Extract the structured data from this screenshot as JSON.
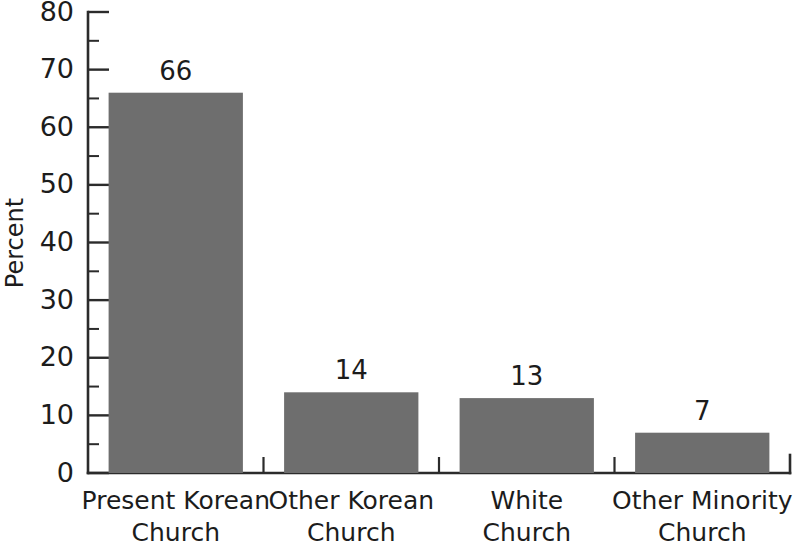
{
  "chart_data": {
    "type": "bar",
    "title": "",
    "subtitle": "",
    "xlabel": "",
    "ylabel": "Percent",
    "categories": [
      "Present Korean Church",
      "Other Korean Church",
      "White Church",
      "Other Minority Church"
    ],
    "category_lines": [
      [
        "Present Korean",
        "Church"
      ],
      [
        "Other Korean",
        "Church"
      ],
      [
        "White",
        "Church"
      ],
      [
        "Other Minority",
        "Church"
      ]
    ],
    "values": [
      66,
      14,
      13,
      7
    ],
    "value_labels": [
      "66",
      "14",
      "13",
      "7"
    ],
    "ylim": [
      0,
      80
    ],
    "ytick_values": [
      0,
      10,
      20,
      30,
      40,
      50,
      60,
      70,
      80
    ],
    "ytick_labels": [
      "0",
      "10",
      "20",
      "30",
      "40",
      "50",
      "60",
      "70",
      "80"
    ],
    "yminor_values": [
      5,
      15,
      25,
      35,
      45,
      55,
      65,
      75
    ],
    "grid": false,
    "legend": false,
    "legend_position": "none",
    "bar_color": "#6e6e6e",
    "axis_color": "#2b2b2b",
    "text_color": "#1c1c1c",
    "background_color": "#ffffff"
  }
}
